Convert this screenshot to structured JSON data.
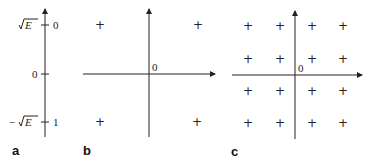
{
  "panels": [
    {
      "id": "a",
      "label": "a",
      "axis": "vertical",
      "ticks": [
        {
          "left": "√E",
          "left_prefix": "",
          "right": "0",
          "y": 25
        },
        {
          "left": "0",
          "left_prefix": "",
          "right": "",
          "y": 74
        },
        {
          "left": "√E",
          "left_prefix": "−",
          "right": "1",
          "y": 122
        }
      ]
    },
    {
      "id": "b",
      "label": "b",
      "origin_label": "0",
      "points": [
        {
          "x": 100,
          "y": 25
        },
        {
          "x": 198,
          "y": 25
        },
        {
          "x": 100,
          "y": 122
        },
        {
          "x": 197,
          "y": 122
        }
      ]
    },
    {
      "id": "c",
      "label": "c",
      "origin_label": "0",
      "grid_cols": [
        248,
        280,
        312,
        343
      ],
      "grid_rows": [
        26,
        59,
        91,
        123
      ]
    }
  ],
  "marker_symbol": "+"
}
